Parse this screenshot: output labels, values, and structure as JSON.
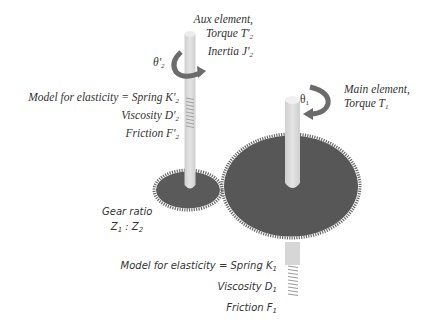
{
  "diagram": {
    "type": "two-inertia gear drive model",
    "aux_element": {
      "title": "Aux element,",
      "torque": "Torque T'",
      "torque_sub": "2",
      "inertia": "Inertia J'",
      "inertia_sub": "2",
      "angle": "θ'",
      "angle_sub": "2"
    },
    "aux_elasticity": {
      "spring": "Model for elasticity = Spring K'",
      "spring_sub": "2",
      "viscosity": "Viscosity D'",
      "viscosity_sub": "2",
      "friction": "Friction F'",
      "friction_sub": "2"
    },
    "main_element": {
      "title": "Main element,",
      "torque": "Torque T",
      "torque_sub": "1",
      "angle": "θ",
      "angle_sub": "1"
    },
    "gear_ratio": {
      "title": "Gear ratio",
      "z1": "Z",
      "z1_sub": "1",
      "sep": " : ",
      "z2": "Z",
      "z2_sub": "2"
    },
    "main_elasticity": {
      "spring": "Model for elasticity = Spring K",
      "spring_sub": "1",
      "viscosity": "Viscosity D",
      "viscosity_sub": "1",
      "friction": "Friction F",
      "friction_sub": "1"
    },
    "colors": {
      "gear": "#5a5a5a",
      "shaft": "#d9d9d9",
      "arrow": "#6b6b6b",
      "text": "#333333"
    }
  }
}
